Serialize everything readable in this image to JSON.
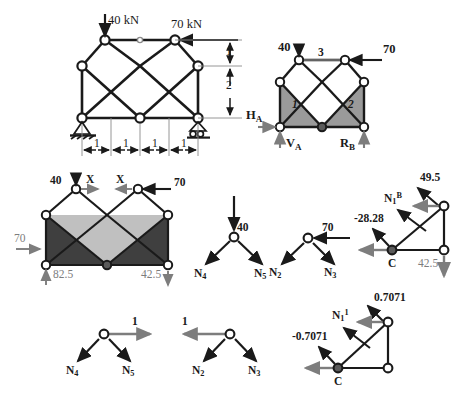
{
  "figure": {
    "colors": {
      "member": "#1a1a1a",
      "force_gray": "#7d7d7d",
      "shade_dark": "#4a4a4a",
      "shade_mid": "#9a9a9a",
      "shade_light": "#c4c4c4",
      "joint_fill": "#ffffff",
      "joint_dark": "#5a5a5a"
    }
  },
  "panels": {
    "truss_main": {
      "name": "main-truss-with-dimensions",
      "loads": [
        {
          "label": "40 kN",
          "direction": "down"
        },
        {
          "label": "70 kN",
          "direction": "left"
        }
      ],
      "dim_vertical": [
        "1",
        "2"
      ],
      "dim_horizontal": [
        "1",
        "1",
        "1",
        "1"
      ]
    },
    "truss_reactions": {
      "name": "truss-free-body-reactions",
      "loads": [
        {
          "label": "40",
          "direction": "down"
        },
        {
          "label": "70",
          "direction": "left"
        }
      ],
      "member_labels": [
        "3",
        "1",
        "2"
      ],
      "reactions": [
        {
          "label": "H",
          "sub": "A",
          "direction": "right"
        },
        {
          "label": "V",
          "sub": "A",
          "direction": "up"
        },
        {
          "label": "R",
          "sub": "B",
          "direction": "up"
        }
      ]
    },
    "truss_section": {
      "name": "truss-section-cut",
      "loads": [
        {
          "label": "40",
          "direction": "down"
        },
        {
          "label": "70",
          "direction": "left"
        },
        {
          "label": "70",
          "direction": "right"
        }
      ],
      "cut_labels": [
        "X",
        "X"
      ],
      "reactions": [
        {
          "label": "82.5",
          "direction": "up"
        },
        {
          "label": "42.5",
          "direction": "down"
        }
      ]
    },
    "joint_a": {
      "name": "joint-equilibrium-40",
      "load": {
        "label": "40",
        "direction": "down"
      },
      "members": [
        "N4",
        "N5"
      ],
      "member_labels": [
        {
          "base": "N",
          "sub": "4"
        },
        {
          "base": "N",
          "sub": "5"
        }
      ]
    },
    "joint_b": {
      "name": "joint-equilibrium-70",
      "load": {
        "label": "70",
        "direction": "left"
      },
      "member_labels": [
        {
          "base": "N",
          "sub": "2"
        },
        {
          "base": "N",
          "sub": "3"
        }
      ]
    },
    "joint_c_real": {
      "name": "joint-c-real-forces",
      "labels": [
        {
          "base": "N",
          "sub": "1",
          "sup": "B"
        },
        {
          "value": "49.5"
        },
        {
          "value": "-28.28"
        },
        {
          "value": "42.5"
        },
        {
          "value": "C"
        }
      ]
    },
    "joint_unit_a": {
      "name": "unit-load-joint-left",
      "load": {
        "label": "1",
        "direction": "right"
      },
      "member_labels": [
        {
          "base": "N",
          "sub": "4"
        },
        {
          "base": "N",
          "sub": "5"
        }
      ]
    },
    "joint_unit_b": {
      "name": "unit-load-joint-right",
      "load": {
        "label": "1",
        "direction": "left"
      },
      "member_labels": [
        {
          "base": "N",
          "sub": "2"
        },
        {
          "base": "N",
          "sub": "3"
        }
      ]
    },
    "joint_c_unit": {
      "name": "joint-c-unit-forces",
      "labels": [
        {
          "base": "N",
          "sub": "1",
          "sup": "1"
        },
        {
          "value": "0.7071"
        },
        {
          "value": "-0.7071"
        },
        {
          "value": "C"
        }
      ]
    }
  }
}
